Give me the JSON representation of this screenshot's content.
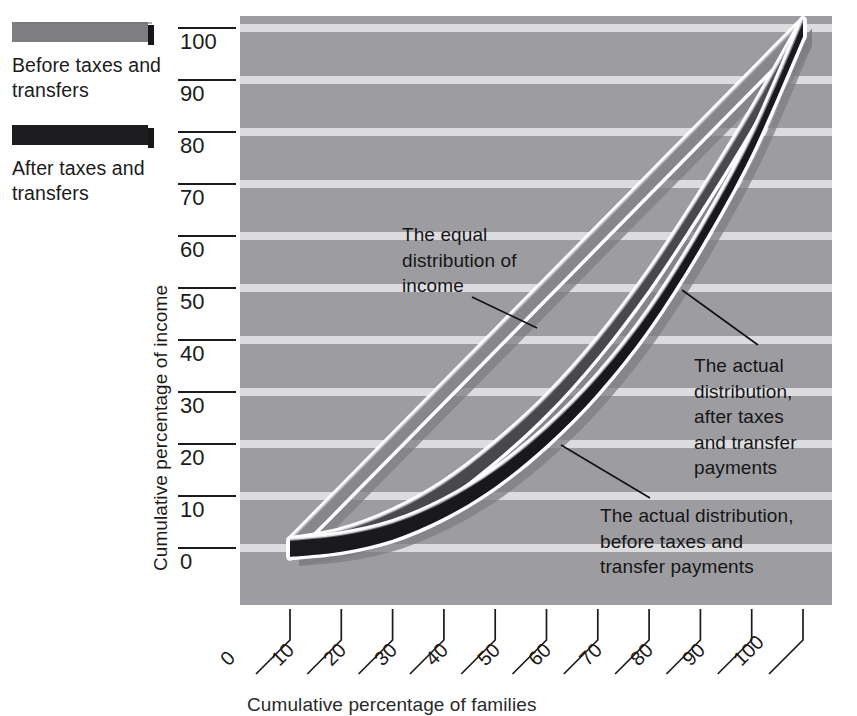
{
  "chart_data": {
    "type": "line",
    "title": "",
    "xlabel": "Cumulative percentage of families",
    "ylabel": "Cumulative percentage of income",
    "xlim": [
      0,
      100
    ],
    "ylim": [
      0,
      100
    ],
    "grid": "horizontal",
    "xticks": [
      0,
      10,
      20,
      30,
      40,
      50,
      60,
      70,
      80,
      90,
      100
    ],
    "yticks": [
      0,
      10,
      20,
      30,
      40,
      50,
      60,
      70,
      80,
      90,
      100
    ],
    "legend_position": "top-left-outside",
    "x": [
      0,
      10,
      20,
      30,
      40,
      50,
      60,
      70,
      80,
      90,
      100
    ],
    "series": [
      {
        "name": "The equal distribution of income",
        "values": [
          0,
          10,
          20,
          30,
          40,
          50,
          60,
          70,
          80,
          90,
          100
        ],
        "color": "#8f8f93"
      },
      {
        "name": "After taxes and transfers",
        "values": [
          0,
          1.8,
          5.5,
          11.0,
          18.5,
          27.5,
          38.5,
          51.5,
          66.5,
          82.5,
          100
        ],
        "color": "#5d5d61"
      },
      {
        "name": "Before taxes and transfers",
        "values": [
          0,
          1.0,
          3.3,
          7.5,
          13.5,
          21.5,
          31.5,
          44.0,
          59.5,
          77.5,
          100
        ],
        "color": "#1d1d20"
      }
    ],
    "annotations": [
      {
        "id": "equal",
        "text": "The equal\ndistribution of\nincome"
      },
      {
        "id": "after",
        "text": "The actual\ndistribution,\nafter taxes\nand transfer\npayments"
      },
      {
        "id": "before",
        "text": "The actual distribution,\nbefore taxes and\ntransfer payments"
      }
    ]
  },
  "legend": {
    "entries": [
      {
        "label": "Before taxes\nand transfers",
        "color": "#7d7d82"
      },
      {
        "label": "After taxes\nand transfers",
        "color": "#1d1d20"
      }
    ]
  },
  "axes": {
    "y": {
      "title": "Cumulative percentage of income",
      "ticks": [
        "100",
        "90",
        "80",
        "70",
        "60",
        "50",
        "40",
        "30",
        "20",
        "10",
        "0"
      ]
    },
    "x": {
      "title": "Cumulative percentage of families",
      "ticks": [
        "0",
        "10",
        "20",
        "30",
        "40",
        "50",
        "60",
        "70",
        "80",
        "90",
        "100"
      ]
    }
  },
  "colors": {
    "plot_background": "#9d9da1",
    "gridline": "#e8e8ea",
    "band_equal": "#8f8f93",
    "band_after": "#55555a",
    "band_before": "#1d1d20",
    "outline": "#ffffff",
    "text": "#1b1b1b"
  }
}
